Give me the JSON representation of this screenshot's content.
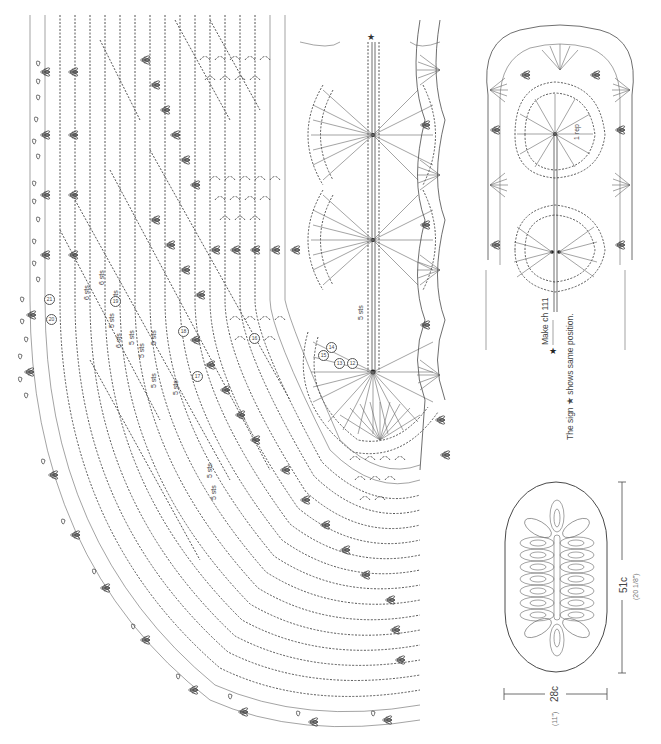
{
  "diagram": {
    "type": "crochet-chart",
    "main_chart": {
      "description": "Half-oval doily crochet chart with pineapple motifs, rotated 90°",
      "start_marker": "★",
      "stitch_labels": [
        {
          "text": "6 sts",
          "x": 83,
          "y": 300
        },
        {
          "text": "6 sts",
          "x": 98,
          "y": 285
        },
        {
          "text": "6 sts",
          "x": 112,
          "y": 300
        },
        {
          "text": "5 sts",
          "x": 108,
          "y": 323
        },
        {
          "text": "6 sts",
          "x": 115,
          "y": 340
        },
        {
          "text": "5 sts",
          "x": 127,
          "y": 338
        },
        {
          "text": "5 sts",
          "x": 137,
          "y": 350
        },
        {
          "text": "5 sts",
          "x": 150,
          "y": 340
        },
        {
          "text": "5 sts",
          "x": 150,
          "y": 380
        },
        {
          "text": "5 sts",
          "x": 172,
          "y": 390
        },
        {
          "text": "5 sts",
          "x": 206,
          "y": 470
        },
        {
          "text": "5 sts",
          "x": 212,
          "y": 505
        },
        {
          "text": "5 sts",
          "x": 357,
          "y": 315
        }
      ],
      "row_markers": [
        {
          "text": "21",
          "x": 48,
          "y": 298
        },
        {
          "text": "20",
          "x": 50,
          "y": 318
        },
        {
          "text": "19",
          "x": 115,
          "y": 300
        },
        {
          "text": "18",
          "x": 182,
          "y": 330
        },
        {
          "text": "17",
          "x": 196,
          "y": 375
        },
        {
          "text": "16",
          "x": 253,
          "y": 337
        },
        {
          "text": "15",
          "x": 322,
          "y": 354
        },
        {
          "text": "14",
          "x": 330,
          "y": 350
        },
        {
          "text": "13",
          "x": 338,
          "y": 362
        },
        {
          "text": "12",
          "x": 351,
          "y": 362
        }
      ]
    },
    "small_chart": {
      "description": "Foundation rows (beginning) detail chart",
      "center_label": "1 rep",
      "foundation_label": "Make ch 111",
      "star_symbol": "★"
    },
    "note": "The sign ★ shows same position.",
    "schematic": {
      "description": "Oval doily outline with leaf motif layout",
      "length_cm": "51c",
      "length_in": "(20 1/8\")",
      "width_cm": "28c",
      "width_in": "(11\")"
    }
  },
  "colors": {
    "ink": "#4a4a4a",
    "background": "#ffffff"
  }
}
